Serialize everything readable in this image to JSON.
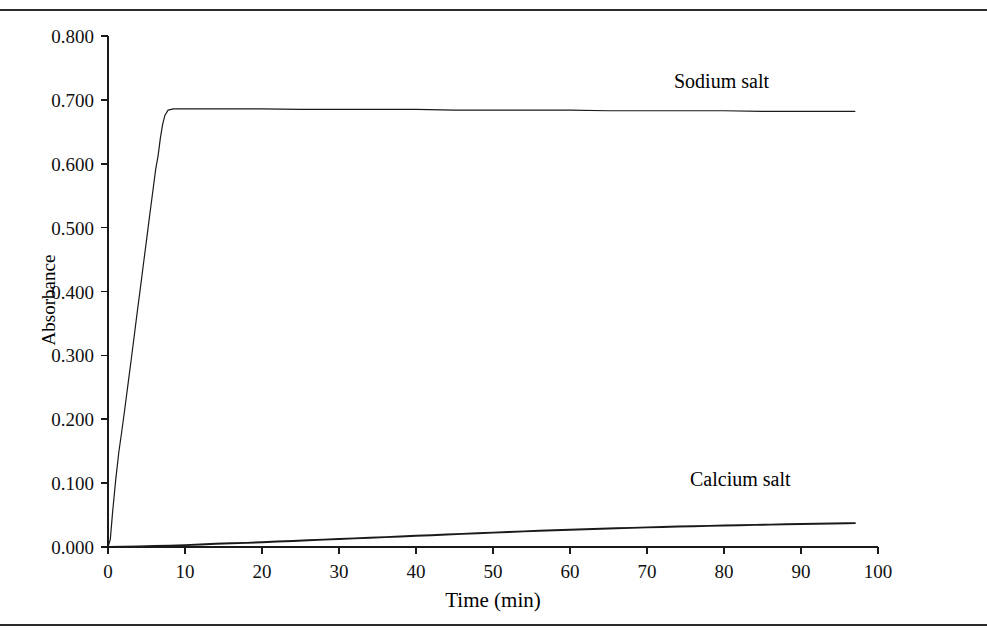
{
  "figure": {
    "background_color": "#ffffff",
    "line_color": "#1a1a1a",
    "rule_color": "#2b2b2b"
  },
  "axes": {
    "y_title": "Absorbance",
    "x_title": "Time (min)",
    "y_ticks": [
      "0.000",
      "0.100",
      "0.200",
      "0.300",
      "0.400",
      "0.500",
      "0.600",
      "0.700",
      "0.800"
    ],
    "x_ticks": [
      "0",
      "10",
      "20",
      "30",
      "40",
      "50",
      "60",
      "70",
      "80",
      "90",
      "100"
    ]
  },
  "labels": {
    "sodium": "Sodium salt",
    "calcium": "Calcium salt"
  },
  "chart_data": {
    "type": "line",
    "title": "",
    "xlabel": "Time (min)",
    "ylabel": "Absorbance",
    "xlim": [
      0,
      100
    ],
    "ylim": [
      0.0,
      0.8
    ],
    "xticks": [
      0,
      10,
      20,
      30,
      40,
      50,
      60,
      70,
      80,
      90,
      100
    ],
    "yticks": [
      0.0,
      0.1,
      0.2,
      0.3,
      0.4,
      0.5,
      0.6,
      0.7,
      0.8
    ],
    "grid": false,
    "legend": "inline-annotations",
    "series": [
      {
        "name": "Sodium salt",
        "color": "#1a1a1a",
        "x": [
          0,
          0.3,
          0.6,
          1.0,
          1.4,
          1.8,
          2.2,
          2.6,
          3.0,
          3.4,
          3.8,
          4.2,
          4.6,
          5.0,
          5.4,
          5.8,
          6.2,
          6.5,
          6.8,
          7.1,
          7.4,
          7.8,
          8.5,
          10,
          15,
          20,
          25,
          30,
          35,
          40,
          45,
          50,
          55,
          60,
          65,
          70,
          75,
          80,
          85,
          90,
          95,
          97
        ],
        "y": [
          0.0,
          0.012,
          0.055,
          0.105,
          0.148,
          0.182,
          0.218,
          0.255,
          0.292,
          0.33,
          0.368,
          0.405,
          0.443,
          0.48,
          0.518,
          0.555,
          0.592,
          0.612,
          0.64,
          0.662,
          0.676,
          0.684,
          0.686,
          0.686,
          0.686,
          0.686,
          0.685,
          0.685,
          0.685,
          0.685,
          0.684,
          0.684,
          0.684,
          0.684,
          0.683,
          0.683,
          0.683,
          0.683,
          0.682,
          0.682,
          0.682,
          0.682
        ]
      },
      {
        "name": "Calcium salt",
        "color": "#1a1a1a",
        "x": [
          0,
          2,
          4,
          6,
          8,
          10,
          12,
          14,
          16,
          18,
          20,
          22,
          24,
          26,
          28,
          30,
          32,
          34,
          36,
          38,
          40,
          42,
          44,
          46,
          48,
          50,
          52,
          54,
          56,
          58,
          60,
          62,
          64,
          66,
          68,
          70,
          72,
          74,
          76,
          78,
          80,
          82,
          84,
          86,
          88,
          90,
          92,
          94,
          96,
          97
        ],
        "y": [
          0.0,
          0.0005,
          0.001,
          0.0015,
          0.002,
          0.003,
          0.004,
          0.005,
          0.0058,
          0.0065,
          0.0075,
          0.0085,
          0.0095,
          0.0105,
          0.0115,
          0.0125,
          0.0135,
          0.0145,
          0.0155,
          0.0165,
          0.0175,
          0.0185,
          0.0195,
          0.0205,
          0.0215,
          0.0225,
          0.0235,
          0.0245,
          0.0255,
          0.0262,
          0.027,
          0.0278,
          0.0286,
          0.0294,
          0.03,
          0.0307,
          0.0314,
          0.032,
          0.0326,
          0.0331,
          0.0336,
          0.0341,
          0.0346,
          0.0351,
          0.0356,
          0.036,
          0.0364,
          0.0368,
          0.0372,
          0.0374
        ]
      }
    ]
  }
}
